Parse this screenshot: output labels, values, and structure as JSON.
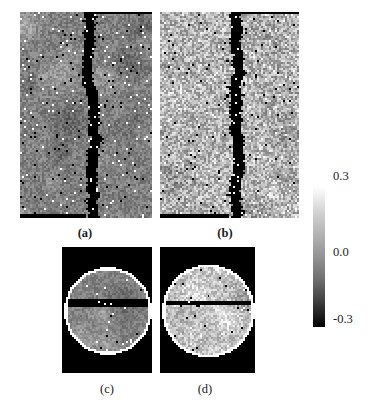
{
  "figure": {
    "kind": "grayscale-image-grid-with-colorbar",
    "background": "#ffffff"
  },
  "panels": [
    {
      "id": "a",
      "caption": "(a)",
      "caption_style": "bold",
      "shape": "rectangular",
      "description": "vertical dark crack band over medium-gray speckled field",
      "mean_level": "medium-gray",
      "base_gray": "#9b9b9b"
    },
    {
      "id": "b",
      "caption": "(b)",
      "caption_style": "bold",
      "shape": "rectangular",
      "description": "vertical dark crack band over bright speckled field",
      "mean_level": "bright-gray",
      "base_gray": "#c9c9c9"
    },
    {
      "id": "c",
      "caption": "(c)",
      "caption_style": "plain",
      "shape": "circular-disk",
      "description": "circular disk on black background with horizontal dark bar",
      "mean_level": "medium-gray",
      "base_gray": "#9b9b9b"
    },
    {
      "id": "d",
      "caption": "(d)",
      "caption_style": "plain",
      "shape": "circular-disk",
      "description": "circular disk on black background with thin horizontal dark line",
      "mean_level": "bright-gray",
      "base_gray": "#cfcfcf"
    }
  ],
  "chart_data": {
    "type": "heatmap",
    "title": "",
    "xlabel": "",
    "ylabel": "",
    "grid": false,
    "legend_position": "right",
    "colorbar": {
      "orientation": "vertical",
      "colormap": "gray",
      "vmin": -0.3,
      "vmax": 0.3,
      "tick_values": [
        0.3,
        0.0,
        -0.3
      ],
      "tick_labels": [
        "0.3",
        "0.0",
        "-0.3"
      ],
      "max_label": "0.3",
      "mid_label": "0.0",
      "min_label": "-0.3",
      "high_color": "#ffffff",
      "mid_color": "#8f8f8f",
      "low_color": "#000000"
    },
    "panels": [
      {
        "name": "(a)",
        "layout": "rectangular",
        "value_range": [
          -0.3,
          0.3
        ],
        "background_value": 0.0,
        "feature": "near-vertical crack at value -0.3",
        "noise_sigma": 0.05
      },
      {
        "name": "(b)",
        "layout": "rectangular",
        "value_range": [
          -0.3,
          0.3
        ],
        "background_value": 0.12,
        "feature": "near-vertical crack at value -0.3",
        "noise_sigma": 0.1
      },
      {
        "name": "(c)",
        "layout": "circular",
        "value_range": [
          -0.3,
          0.3
        ],
        "background_value": 0.0,
        "outside_disk_value": -0.3,
        "feature": "horizontal bar at value -0.3",
        "noise_sigma": 0.04
      },
      {
        "name": "(d)",
        "layout": "circular",
        "value_range": [
          -0.3,
          0.3
        ],
        "background_value": 0.15,
        "outside_disk_value": -0.3,
        "feature": "thin horizontal line at value -0.3",
        "noise_sigma": 0.07
      }
    ]
  }
}
